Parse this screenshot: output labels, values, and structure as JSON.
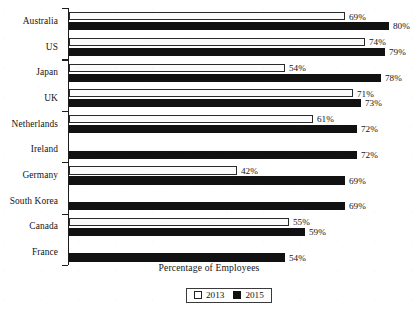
{
  "chart_data": {
    "type": "bar",
    "orientation": "horizontal",
    "title": "",
    "xlabel": "Percentage of Employees",
    "ylabel": "",
    "categories": [
      "Australia",
      "US",
      "Japan",
      "UK",
      "Netherlands",
      "Ireland",
      "Germany",
      "South Korea",
      "Canada",
      "France"
    ],
    "series": [
      {
        "name": "2013",
        "color": "#ffffff",
        "values": [
          69,
          74,
          54,
          71,
          61,
          null,
          42,
          null,
          55,
          null
        ],
        "labels": [
          "69%",
          "74%",
          "54%",
          "71%",
          "61%",
          "",
          "42%",
          "",
          "55%",
          ""
        ]
      },
      {
        "name": "2015",
        "color": "#111111",
        "values": [
          80,
          79,
          78,
          73,
          72,
          72,
          69,
          69,
          59,
          54
        ],
        "labels": [
          "80%",
          "79%",
          "78%",
          "73%",
          "72%",
          "72%",
          "69%",
          "69%",
          "59%",
          "54%"
        ]
      }
    ],
    "xlim": [
      0,
      84
    ],
    "grid": false,
    "legend_position": "bottom-center",
    "legend_entries": [
      "2013",
      "2015"
    ],
    "value_suffix": "%"
  },
  "axis": {
    "x_title": "Percentage of Employees"
  },
  "legend": {
    "items": [
      {
        "label": "2013",
        "swatch": "open-square"
      },
      {
        "label": "2015",
        "swatch": "filled-square"
      }
    ]
  },
  "colors": {
    "bar_2013_fill": "#fbfbfb",
    "bar_2013_stroke": "#2a2a2a",
    "bar_2015_fill": "#111111",
    "axis": "#1c1c1c",
    "text": "#141414",
    "background": "#ffffff"
  }
}
